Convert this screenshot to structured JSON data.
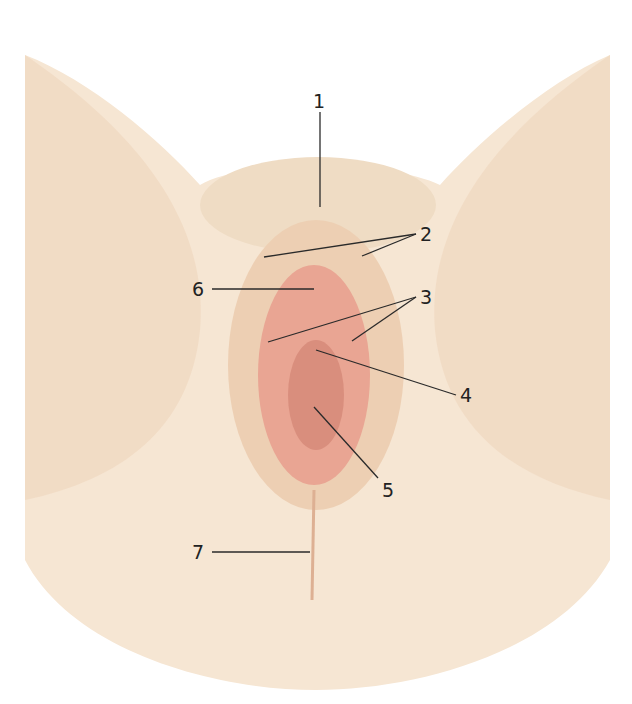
{
  "figure": {
    "type": "anatomical-illustration",
    "colors": {
      "skin_light": "#f6e6d3",
      "skin_mid": "#edcfb3",
      "skin_shadow": "#ddb093",
      "mucosa": "#e9a593",
      "mucosa_dark": "#cf7f6e",
      "line": "#2a2a2a"
    }
  },
  "labels": [
    {
      "id": "1",
      "text": "1"
    },
    {
      "id": "2",
      "text": "2"
    },
    {
      "id": "3",
      "text": "3"
    },
    {
      "id": "4",
      "text": "4"
    },
    {
      "id": "5",
      "text": "5"
    },
    {
      "id": "6",
      "text": "6"
    },
    {
      "id": "7",
      "text": "7"
    }
  ]
}
